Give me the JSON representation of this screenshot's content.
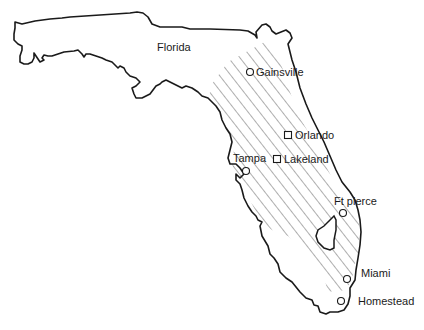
{
  "map": {
    "region_label": "Florida",
    "shaded_region": "central Florida band (hatched)",
    "colors": {
      "outline": "#1a1a1a",
      "hatch": "#333333",
      "background": "#ffffff"
    },
    "cities": [
      {
        "name": "Gainsville",
        "marker": "circle",
        "x": 250,
        "y": 72,
        "label_x": 256,
        "label_y": 76
      },
      {
        "name": "Orlando",
        "marker": "square",
        "x": 288,
        "y": 135,
        "label_x": 295,
        "label_y": 139
      },
      {
        "name": "Lakeland",
        "marker": "square",
        "x": 277,
        "y": 159,
        "label_x": 283,
        "label_y": 163
      },
      {
        "name": "Tampa",
        "marker": "circle",
        "x": 246,
        "y": 171,
        "label_x": 233,
        "label_y": 162
      },
      {
        "name": "Ft pierce",
        "marker": "circle",
        "x": 343,
        "y": 213,
        "label_x": 334,
        "label_y": 205
      },
      {
        "name": "Miami",
        "marker": "circle",
        "x": 347,
        "y": 279,
        "label_x": 361,
        "label_y": 277
      },
      {
        "name": "Homestead",
        "marker": "circle",
        "x": 341,
        "y": 301,
        "label_x": 358,
        "label_y": 305
      }
    ]
  }
}
